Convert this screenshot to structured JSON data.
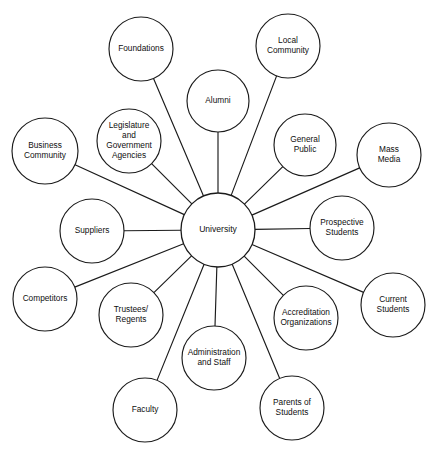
{
  "diagram": {
    "type": "hub-and-spoke",
    "canvas": {
      "width": 437,
      "height": 457
    },
    "colors": {
      "background": "#ffffff",
      "stroke": "#1b1b1b",
      "text": "#0f0f0f"
    },
    "hub": {
      "id": "university",
      "label": "University",
      "lines": [
        "University"
      ],
      "cx": 218,
      "cy": 230,
      "r": 37
    },
    "nodes": [
      {
        "id": "foundations",
        "label": "Foundations",
        "lines": [
          "Foundations"
        ],
        "cx": 141,
        "cy": 49,
        "r": 32
      },
      {
        "id": "local-community",
        "label": "Local Community",
        "lines": [
          "Local",
          "Community"
        ],
        "cx": 288,
        "cy": 46,
        "r": 32
      },
      {
        "id": "alumni",
        "label": "Alumni",
        "lines": [
          "Alumni"
        ],
        "cx": 218,
        "cy": 101,
        "r": 31
      },
      {
        "id": "legislature",
        "label": "Legislature and Government Agencies",
        "lines": [
          "Legislature",
          "and",
          "Government",
          "Agencies"
        ],
        "cx": 129,
        "cy": 141,
        "r": 32
      },
      {
        "id": "general-public",
        "label": "General Public",
        "lines": [
          "General",
          "Public"
        ],
        "cx": 305,
        "cy": 145,
        "r": 31
      },
      {
        "id": "business-community",
        "label": "Business Community",
        "lines": [
          "Business",
          "Community"
        ],
        "cx": 45,
        "cy": 151,
        "r": 33
      },
      {
        "id": "mass-media",
        "label": "Mass Media",
        "lines": [
          "Mass",
          "Media"
        ],
        "cx": 389,
        "cy": 155,
        "r": 32
      },
      {
        "id": "suppliers",
        "label": "Suppliers",
        "lines": [
          "Suppliers"
        ],
        "cx": 92,
        "cy": 231,
        "r": 32
      },
      {
        "id": "prospective-students",
        "label": "Prospective Students",
        "lines": [
          "Prospective",
          "Students"
        ],
        "cx": 342,
        "cy": 228,
        "r": 32
      },
      {
        "id": "competitors",
        "label": "Competitors",
        "lines": [
          "Competitors"
        ],
        "cx": 45,
        "cy": 299,
        "r": 32
      },
      {
        "id": "current-students",
        "label": "Current Students",
        "lines": [
          "Current",
          "Students"
        ],
        "cx": 393,
        "cy": 305,
        "r": 32
      },
      {
        "id": "trustees-regents",
        "label": "Trustees/ Regents",
        "lines": [
          "Trustees/",
          "Regents"
        ],
        "cx": 131,
        "cy": 315,
        "r": 32
      },
      {
        "id": "accreditation-organizations",
        "label": "Accreditation Organizations",
        "lines": [
          "Accreditation",
          "Organizations"
        ],
        "cx": 306,
        "cy": 318,
        "r": 32
      },
      {
        "id": "administration-and-staff",
        "label": "Administration and Staff",
        "lines": [
          "Administration",
          "and Staff"
        ],
        "cx": 214,
        "cy": 358,
        "r": 32
      },
      {
        "id": "faculty",
        "label": "Faculty",
        "lines": [
          "Faculty"
        ],
        "cx": 145,
        "cy": 410,
        "r": 32
      },
      {
        "id": "parents-of-students",
        "label": "Parents of Students",
        "lines": [
          "Parents of",
          "Students"
        ],
        "cx": 292,
        "cy": 408,
        "r": 32
      }
    ],
    "edges": [
      {
        "from": "university",
        "to": "foundations"
      },
      {
        "from": "university",
        "to": "local-community"
      },
      {
        "from": "university",
        "to": "alumni"
      },
      {
        "from": "university",
        "to": "legislature"
      },
      {
        "from": "university",
        "to": "general-public"
      },
      {
        "from": "university",
        "to": "business-community"
      },
      {
        "from": "university",
        "to": "mass-media"
      },
      {
        "from": "university",
        "to": "suppliers"
      },
      {
        "from": "university",
        "to": "prospective-students"
      },
      {
        "from": "university",
        "to": "competitors"
      },
      {
        "from": "university",
        "to": "current-students"
      },
      {
        "from": "university",
        "to": "trustees-regents"
      },
      {
        "from": "university",
        "to": "accreditation-organizations"
      },
      {
        "from": "university",
        "to": "administration-and-staff"
      },
      {
        "from": "university",
        "to": "faculty"
      },
      {
        "from": "university",
        "to": "parents-of-students"
      }
    ]
  }
}
